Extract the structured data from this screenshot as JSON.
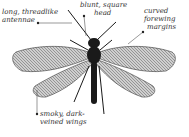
{
  "figure": {
    "labels": [
      {
        "id": "antennae",
        "lines": [
          "long, threadlike",
          "antennae"
        ]
      },
      {
        "id": "head",
        "lines": [
          "blunt, square",
          "head"
        ]
      },
      {
        "id": "forewing",
        "lines": [
          "curved",
          "forewing",
          "margins"
        ]
      },
      {
        "id": "wings",
        "lines": [
          "smoky, dark-",
          "veined wings"
        ]
      }
    ]
  },
  "colors": {
    "background": "#ffffff",
    "label_text": "#333333",
    "leader_line": "#555555",
    "body": "#1a1a1a",
    "wing_fill": "#c8c8c8",
    "wing_vein": "#3a3a3a"
  }
}
